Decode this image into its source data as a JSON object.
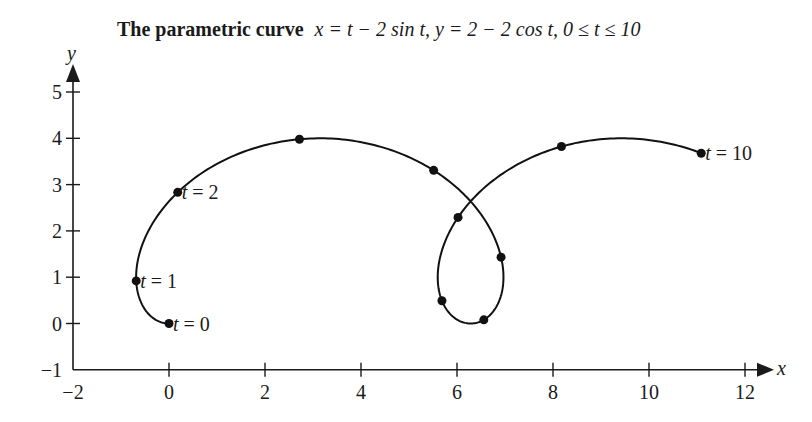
{
  "chart_data": {
    "type": "line",
    "title": {
      "bold_part": "The parametric curve",
      "math_part": "x = t − 2 sin t, y = 2 − 2 cos t, 0 ≤ t ≤ 10"
    },
    "xlabel": "x",
    "ylabel": "y",
    "xlim": [
      -2,
      12
    ],
    "ylim": [
      -1,
      5
    ],
    "x_ticks": [
      -2,
      0,
      2,
      4,
      6,
      8,
      10,
      12
    ],
    "y_ticks": [
      -1,
      0,
      1,
      2,
      3,
      4,
      5
    ],
    "grid": false,
    "legend": null,
    "series": [
      {
        "name": "parametric curve",
        "x_of_t": "t - 2*sin(t)",
        "y_of_t": "2 - 2*cos(t)",
        "t_range": [
          0,
          10
        ],
        "color": "#111111"
      }
    ],
    "marked_points": [
      {
        "t": 0,
        "x": 0.0,
        "y": 0.0,
        "label": "t = 0"
      },
      {
        "t": 1,
        "x": -0.68,
        "y": 0.92,
        "label": "t = 1"
      },
      {
        "t": 2,
        "x": 0.18,
        "y": 2.83,
        "label": "t = 2"
      },
      {
        "t": 3,
        "x": 2.72,
        "y": 3.98,
        "label": ""
      },
      {
        "t": 4,
        "x": 5.51,
        "y": 3.31,
        "label": ""
      },
      {
        "t": 5,
        "x": 6.92,
        "y": 1.43,
        "label": ""
      },
      {
        "t": 6,
        "x": 6.56,
        "y": 0.08,
        "label": ""
      },
      {
        "t": 7,
        "x": 5.69,
        "y": 0.49,
        "label": ""
      },
      {
        "t": 8,
        "x": 6.02,
        "y": 2.29,
        "label": ""
      },
      {
        "t": 9,
        "x": 8.18,
        "y": 3.82,
        "label": ""
      },
      {
        "t": 10,
        "x": 11.09,
        "y": 3.68,
        "label": "t = 10"
      }
    ]
  }
}
